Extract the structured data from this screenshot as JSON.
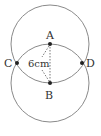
{
  "diagram": {
    "points": {
      "A": {
        "label": "A",
        "x": 50,
        "y": 44
      },
      "B": {
        "label": "B",
        "x": 50,
        "y": 83
      },
      "C": {
        "label": "C",
        "x": 17,
        "y": 63
      },
      "D": {
        "label": "D",
        "x": 82,
        "y": 63
      }
    },
    "circles": [
      {
        "center": "A",
        "radius": 39
      },
      {
        "center": "B",
        "radius": 39
      }
    ],
    "measurement": {
      "label": "6cm",
      "segment": "AB"
    },
    "colors": {
      "stroke": "#8a8a8a",
      "point": "#222222",
      "text": "#333333"
    }
  }
}
